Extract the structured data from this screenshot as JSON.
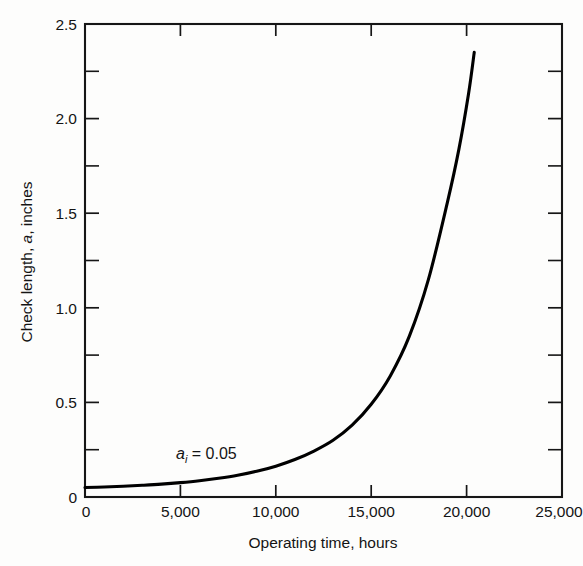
{
  "chart_data": {
    "type": "line",
    "title": "",
    "subtitle": "",
    "xlabel": "Operating time, hours",
    "ylabel": "Check length, a, inches",
    "ylabel_parts": {
      "prefix": "Check length, ",
      "italic": "a",
      "suffix": ", inches"
    },
    "xlim": [
      0,
      25000
    ],
    "ylim": [
      0,
      2.5
    ],
    "grid": false,
    "legend": null,
    "x_ticks": [
      0,
      5000,
      10000,
      15000,
      20000,
      25000
    ],
    "x_tick_labels": [
      "0",
      "5,000",
      "10,000",
      "15,000",
      "20,000",
      "25,000"
    ],
    "y_ticks": [
      0,
      0.5,
      1.0,
      1.5,
      2.0,
      2.5
    ],
    "y_tick_labels": [
      "0",
      "0.5",
      "1.0",
      "1.5",
      "2.0",
      "2.5"
    ],
    "y_minor_ticks": [
      0.25,
      0.75,
      1.25,
      1.75,
      2.25
    ],
    "annotations": [
      {
        "text": "a_i = 0.05",
        "symbol": "a",
        "subscript": "i",
        "equals": " = ",
        "value": "0.05",
        "x": 8200,
        "y": 0.3
      }
    ],
    "series": [
      {
        "name": "Check length growth",
        "color": "#000000",
        "x": [
          0,
          1000,
          2000,
          3000,
          4000,
          5000,
          6000,
          7000,
          8000,
          9000,
          10000,
          11000,
          12000,
          13000,
          14000,
          15000,
          16000,
          17000,
          18000,
          19000,
          19600,
          20100,
          20400
        ],
        "values": [
          0.05,
          0.053,
          0.057,
          0.062,
          0.068,
          0.076,
          0.086,
          0.099,
          0.115,
          0.136,
          0.163,
          0.198,
          0.243,
          0.3,
          0.38,
          0.49,
          0.64,
          0.85,
          1.15,
          1.56,
          1.84,
          2.13,
          2.35
        ]
      }
    ]
  },
  "axes": {
    "spine_color": "#161616",
    "tick_direction": "in"
  }
}
